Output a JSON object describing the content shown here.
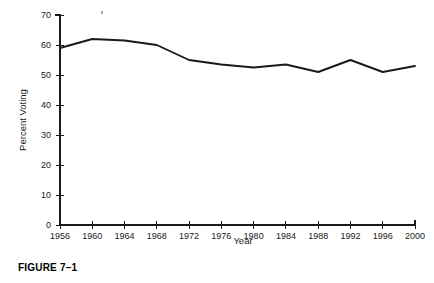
{
  "figure": {
    "caption": "FIGURE 7–1"
  },
  "chart_data": {
    "type": "line",
    "title": "",
    "xlabel": "Year",
    "ylabel": "Percent Voting",
    "categories": [
      1956,
      1960,
      1964,
      1968,
      1972,
      1976,
      1980,
      1984,
      1988,
      1992,
      1996,
      2000
    ],
    "x_tick_labels": [
      "1956",
      "1960",
      "1964",
      "1968",
      "1972",
      "1976",
      "1980",
      "1984",
      "1988",
      "1992",
      "1996",
      "2000"
    ],
    "values": [
      59,
      62,
      61.5,
      60,
      55,
      53.5,
      52.5,
      53.5,
      51,
      55,
      51,
      53
    ],
    "y_tick_labels": [
      "0",
      "10",
      "20",
      "30",
      "40",
      "50",
      "60",
      "70"
    ],
    "y_ticks": [
      0,
      10,
      20,
      30,
      40,
      50,
      60,
      70
    ],
    "xlim": [
      1956,
      2000
    ],
    "ylim": [
      0,
      70
    ],
    "grid": false,
    "legend": false,
    "series": [
      {
        "name": "Percent Voting",
        "color": "#1a1a1a",
        "values": [
          59,
          62,
          61.5,
          60,
          55,
          53.5,
          52.5,
          53.5,
          51,
          55,
          51,
          53
        ]
      }
    ]
  }
}
